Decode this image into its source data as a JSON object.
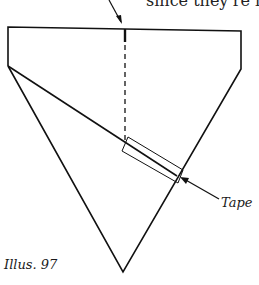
{
  "figure": {
    "top_text": "since they're in",
    "label": "Tape",
    "caption": "Illus. 97"
  },
  "colors": {
    "line": "#111111",
    "background": "#ffffff"
  }
}
